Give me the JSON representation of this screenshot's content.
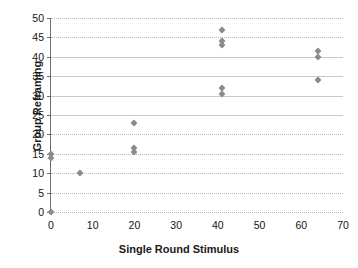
{
  "chart_data": {
    "type": "scatter",
    "title": "",
    "xlabel": "Single Round Stimulus",
    "ylabel": "Group Reframing",
    "xlim": [
      0,
      70
    ],
    "ylim": [
      0,
      50
    ],
    "xticks": [
      0,
      10,
      20,
      30,
      40,
      50,
      60,
      70
    ],
    "yticks": [
      0,
      5,
      10,
      15,
      20,
      25,
      30,
      35,
      40,
      45,
      50
    ],
    "grid": true,
    "legend": false,
    "marker": "diamond",
    "marker_color": "#8b8b8b",
    "points": [
      {
        "x": 0,
        "y": 0
      },
      {
        "x": 0,
        "y": 15
      },
      {
        "x": 0,
        "y": 14
      },
      {
        "x": 7,
        "y": 10
      },
      {
        "x": 20,
        "y": 23
      },
      {
        "x": 20,
        "y": 16.5
      },
      {
        "x": 20,
        "y": 15.5
      },
      {
        "x": 41,
        "y": 47
      },
      {
        "x": 41,
        "y": 44
      },
      {
        "x": 41,
        "y": 43
      },
      {
        "x": 41,
        "y": 32
      },
      {
        "x": 41,
        "y": 30.5
      },
      {
        "x": 64,
        "y": 41.5
      },
      {
        "x": 64,
        "y": 40
      },
      {
        "x": 64,
        "y": 34
      }
    ]
  },
  "axes": {
    "y_tick_labels": [
      "0",
      "5",
      "10",
      "15",
      "20",
      "25",
      "30",
      "35",
      "40",
      "45",
      "50"
    ],
    "x_tick_labels": [
      "0",
      "10",
      "20",
      "30",
      "40",
      "50",
      "60",
      "70"
    ],
    "y_title": "Group Reframing",
    "x_title": "Single Round Stimulus"
  }
}
